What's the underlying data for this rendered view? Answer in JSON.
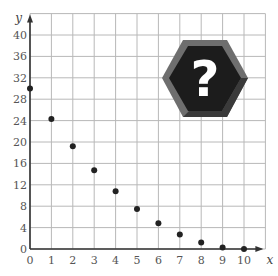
{
  "chart_data": {
    "type": "scatter",
    "title": "",
    "xlabel": "x",
    "ylabel": "y",
    "xlim": [
      0,
      11
    ],
    "ylim": [
      0,
      44
    ],
    "x_ticks": [
      0,
      1,
      2,
      3,
      4,
      5,
      6,
      7,
      8,
      9,
      10
    ],
    "y_ticks": [
      0,
      4,
      8,
      12,
      16,
      20,
      24,
      28,
      32,
      36,
      40
    ],
    "grid": true,
    "x_grid_step": 1,
    "y_grid_step": 4,
    "series": [
      {
        "name": "points",
        "x": [
          0,
          1,
          2,
          3,
          4,
          5,
          6,
          7,
          8,
          9,
          10
        ],
        "y": [
          30,
          24.3,
          19.2,
          14.7,
          10.8,
          7.5,
          4.8,
          2.7,
          1.2,
          0.3,
          0
        ]
      }
    ],
    "annotations": [
      {
        "type": "icon",
        "name": "question-mark-hexagon",
        "text": "?",
        "placement": "top-right"
      }
    ],
    "colors": {
      "points": "#222222",
      "grid": "#b8b8b8",
      "axis": "#333333",
      "badge": "#1a1a1a"
    }
  },
  "labels": {
    "x_axis": "x",
    "y_axis": "y",
    "badge": "?"
  }
}
